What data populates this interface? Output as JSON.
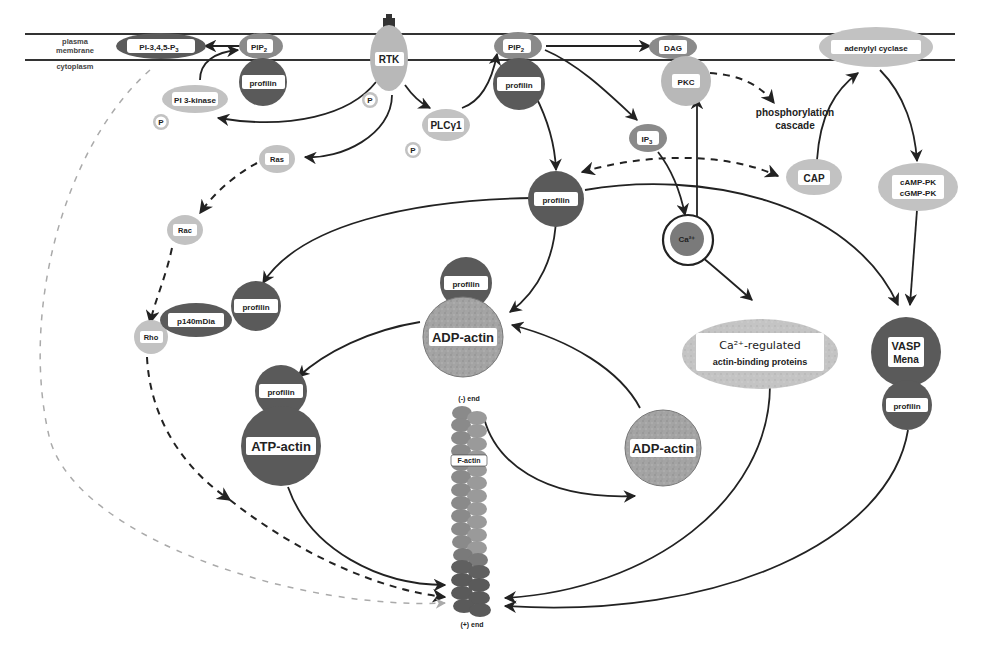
{
  "colors": {
    "dark_node": "#5a5a5a",
    "medium_node": "#8a8a8a",
    "light_node": "#c2c2c2",
    "textured_node": "#9a9a9a",
    "line": "#222222",
    "membrane_line": "#333333",
    "light_dash": "#aaaaaa",
    "background": "#ffffff"
  },
  "membrane": {
    "top_label": "plasma",
    "mid_label": "membrane",
    "bottom_label": "cytoplasm"
  },
  "nodes": {
    "pi345p3": {
      "label": "PI-3,4,5-P",
      "subscript": "3"
    },
    "pip2_left": {
      "label": "PIP",
      "subscript": "2"
    },
    "profilin_topleft": {
      "label": "profilin"
    },
    "pi3kinase": {
      "label": "PI 3-kinase"
    },
    "p_pi3k": {
      "label": "P"
    },
    "rtk": {
      "label": "RTK"
    },
    "p_rtk": {
      "label": "P"
    },
    "plcg1": {
      "label": "PLCγ1"
    },
    "p_plc": {
      "label": "P"
    },
    "pip2_mid": {
      "label": "PIP",
      "subscript": "2"
    },
    "profilin_topmid": {
      "label": "profilin"
    },
    "dag": {
      "label": "DAG"
    },
    "pkc": {
      "label": "PKC"
    },
    "phosphorylation": {
      "line1": "phosphorylation",
      "line2": "cascade"
    },
    "adenylyl_cyclase": {
      "label": "adenylyl cyclase"
    },
    "ip3": {
      "label": "IP",
      "subscript": "3"
    },
    "cap": {
      "label": "CAP"
    },
    "camp_pk": {
      "line1": "cAMP-PK",
      "line2": "cGMP-PK"
    },
    "ras": {
      "label": "Ras"
    },
    "rac": {
      "label": "Rac"
    },
    "profilin_center": {
      "label": "profilin"
    },
    "ca2": {
      "label": "Ca²⁺"
    },
    "rho": {
      "label": "Rho"
    },
    "p140mdia": {
      "label": "p140mDia"
    },
    "profilin_mdia": {
      "label": "profilin"
    },
    "profilin_adp": {
      "label": "profilin"
    },
    "adp_actin_top": {
      "label": "ADP-actin"
    },
    "ca_proteins": {
      "line1": "Ca²⁺-regulated",
      "line2": "actin-binding   proteins"
    },
    "vasp": {
      "line1": "VASP",
      "line2": "Mena"
    },
    "profilin_vasp": {
      "label": "profilin"
    },
    "profilin_atp": {
      "label": "profilin"
    },
    "atp_actin": {
      "label": "ATP-actin"
    },
    "adp_actin_right": {
      "label": "ADP-actin"
    },
    "f_actin": {
      "label": "F-actin",
      "minus_end": "(-) end",
      "plus_end": "(+) end"
    }
  }
}
